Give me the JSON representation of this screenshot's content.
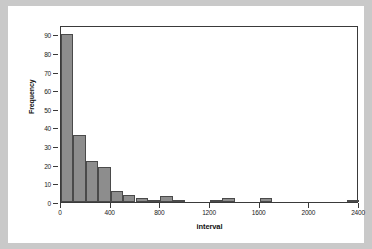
{
  "chart_data": {
    "type": "bar",
    "title": "",
    "subtitle": "",
    "xlabel": "interval",
    "ylabel": "Frequency",
    "xlim": [
      0,
      2400
    ],
    "ylim": [
      0,
      95
    ],
    "grid": false,
    "legend": null,
    "bin_width": 100,
    "bar_color": "#8d8d8d",
    "bar_edge_color": "#4a4a4a",
    "frame_color": "#3a3a3a",
    "background": "#ffffff",
    "page_background": "#c9c9c9",
    "ytick_labels": [
      "0",
      "10",
      "20",
      "30",
      "40",
      "50",
      "60",
      "70",
      "80",
      "90"
    ],
    "ytick_values": [
      0,
      10,
      20,
      30,
      40,
      50,
      60,
      70,
      80,
      90
    ],
    "xtick_labels": [
      "0",
      "400",
      "800",
      "1200",
      "1600",
      "2000",
      "2400"
    ],
    "xtick_values": [
      0,
      400,
      800,
      1200,
      1600,
      2000,
      2400
    ],
    "categories": [
      "0-100",
      "100-200",
      "200-300",
      "300-400",
      "400-500",
      "500-600",
      "600-700",
      "700-800",
      "800-900",
      "900-1000",
      "1000-1100",
      "1100-1200",
      "1200-1300",
      "1300-1400",
      "1400-1500",
      "1500-1600",
      "1600-1700",
      "1700-1800",
      "1800-1900",
      "1900-2000",
      "2000-2100",
      "2100-2200",
      "2200-2300",
      "2300-2400"
    ],
    "x_left_edges": [
      0,
      100,
      200,
      300,
      400,
      500,
      600,
      700,
      800,
      900,
      1000,
      1100,
      1200,
      1300,
      1400,
      1500,
      1600,
      1700,
      1800,
      1900,
      2000,
      2100,
      2200,
      2300
    ],
    "values": [
      90,
      36,
      22,
      19,
      6,
      4,
      2,
      1,
      3,
      1,
      0,
      0,
      1,
      2,
      0,
      0,
      2,
      0,
      0,
      0,
      0,
      0,
      0,
      1
    ]
  }
}
